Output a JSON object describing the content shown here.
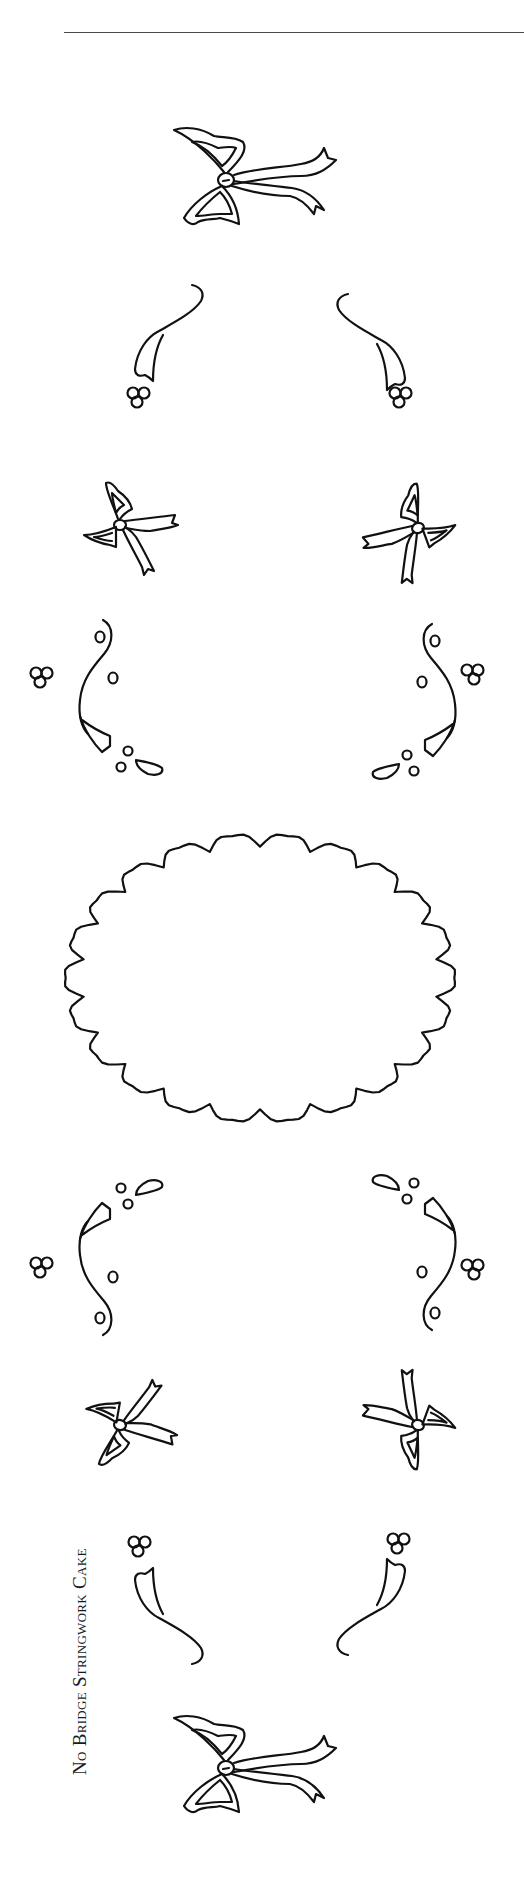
{
  "page": {
    "caption": "No Bridge Stringwork Cake",
    "rule_color": "#4a4a4a",
    "line_color": "#111111",
    "background": "#ffffff"
  },
  "pattern": {
    "elements": [
      {
        "name": "top-center-bow",
        "type": "bow"
      },
      {
        "name": "upper-left-swag",
        "type": "swag"
      },
      {
        "name": "upper-right-swag",
        "type": "swag"
      },
      {
        "name": "upper-left-dot-cluster",
        "type": "three-dot-cluster"
      },
      {
        "name": "upper-right-dot-cluster",
        "type": "three-dot-cluster"
      },
      {
        "name": "upper-left-bow",
        "type": "bow"
      },
      {
        "name": "upper-right-bow",
        "type": "bow"
      },
      {
        "name": "upper-left-scroll",
        "type": "s-scroll"
      },
      {
        "name": "upper-right-scroll",
        "type": "s-scroll"
      },
      {
        "name": "center-scalloped-oval",
        "type": "plaque"
      },
      {
        "name": "lower-left-scroll",
        "type": "s-scroll"
      },
      {
        "name": "lower-right-scroll",
        "type": "s-scroll"
      },
      {
        "name": "lower-left-bow",
        "type": "bow"
      },
      {
        "name": "lower-right-bow",
        "type": "bow"
      },
      {
        "name": "lower-left-swag",
        "type": "swag"
      },
      {
        "name": "lower-right-swag",
        "type": "swag"
      },
      {
        "name": "bottom-center-bow",
        "type": "bow"
      }
    ]
  }
}
